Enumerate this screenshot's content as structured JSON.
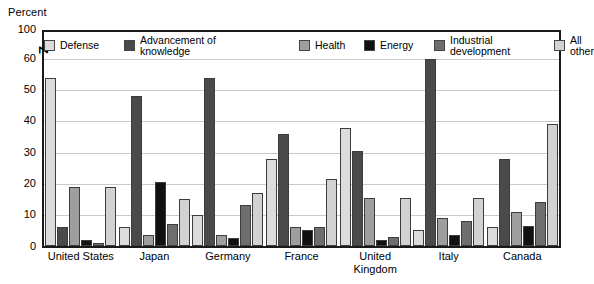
{
  "chart_data": {
    "type": "bar",
    "title": "",
    "ylabel": "Percent",
    "xlabel": "",
    "ylim": [
      0,
      100
    ],
    "grid": true,
    "legend_position": "top-inside",
    "axis_break": {
      "present": true,
      "marker": "Z",
      "between": [
        60,
        100
      ],
      "note": "Y axis is broken between 60 and 100"
    },
    "ytick_labels": [
      "100",
      "60",
      "50",
      "40",
      "30",
      "20",
      "10",
      "0"
    ],
    "categories": [
      "United States",
      "Japan",
      "Germany",
      "France",
      "United Kingdom",
      "Italy",
      "Canada"
    ],
    "series": [
      {
        "name": "Defense",
        "color": "#dcdcdc",
        "values": [
          54,
          6,
          10,
          28,
          38,
          5,
          6
        ]
      },
      {
        "name": "Advancement of\nknowledge",
        "color": "#4a4a4a",
        "values": [
          6,
          48,
          54,
          36,
          30.5,
          60,
          28
        ]
      },
      {
        "name": "Health",
        "color": "#9e9e9e",
        "values": [
          19,
          3.5,
          3.5,
          6,
          15.5,
          9,
          11
        ]
      },
      {
        "name": "Energy",
        "color": "#111111",
        "values": [
          2,
          20.5,
          2.5,
          5,
          2,
          3.5,
          6.5
        ]
      },
      {
        "name": "Industrial\ndevelopment",
        "color": "#6e6e6e",
        "values": [
          1,
          7,
          13,
          6,
          3,
          8,
          14
        ]
      },
      {
        "name": "All other",
        "color": "#d2d2d2",
        "values": [
          19,
          15,
          17,
          21.5,
          15.5,
          15.5,
          39
        ]
      }
    ]
  }
}
